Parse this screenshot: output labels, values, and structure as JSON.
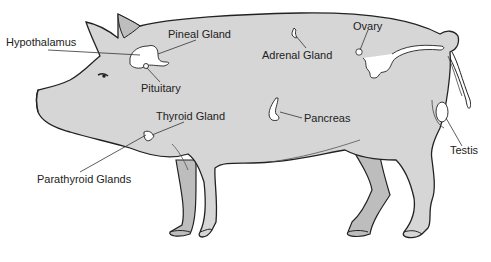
{
  "diagram": {
    "colors": {
      "body": "#d6d6d6",
      "body_shade": "#bdbdbd",
      "outline": "#222222",
      "gland": "#ffffff",
      "leader": "#333333",
      "text": "#222222"
    },
    "labels": [
      {
        "id": "hypothalamus",
        "text": "Hypothalamus"
      },
      {
        "id": "pineal",
        "text": "Pineal Gland"
      },
      {
        "id": "pituitary",
        "text": "Pituitary"
      },
      {
        "id": "thyroid",
        "text": "Thyroid Gland"
      },
      {
        "id": "parathyroid",
        "text": "Parathyroid Glands"
      },
      {
        "id": "adrenal",
        "text": "Adrenal Gland"
      },
      {
        "id": "ovary",
        "text": "Ovary"
      },
      {
        "id": "pancreas",
        "text": "Pancreas"
      },
      {
        "id": "testis",
        "text": "Testis"
      }
    ]
  }
}
